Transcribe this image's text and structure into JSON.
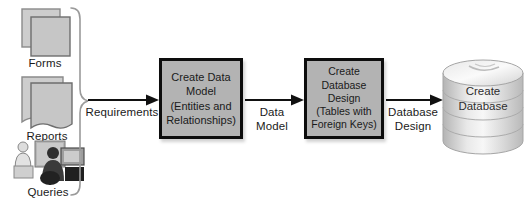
{
  "diagram": {
    "title_hint": "database design process flow",
    "sources": [
      {
        "label": "Forms",
        "icon": "forms-icon"
      },
      {
        "label": "Reports",
        "icon": "reports-icon"
      },
      {
        "label": "Queries",
        "icon": "queries-icon"
      }
    ],
    "flow": {
      "arrow1_label": "Requirements",
      "step1_text": "Create Data\nModel\n(Entities and\nRelationships)",
      "arrow2_label": "Data\nModel",
      "step2_text": "Create\nDatabase\nDesign\n(Tables with\nForeign Keys)",
      "arrow3_label": "Database\nDesign",
      "step3_text": "Create\nDatabase"
    },
    "colors": {
      "box_fill": "#b3b3b3",
      "box_border": "#0d0d0d",
      "icon_fill": "#c9c9c9",
      "icon_stroke": "#7d7d7d",
      "brace": "#9a9a9a",
      "arrow": "#111111",
      "text": "#1a1a1a",
      "cylinder_light": "#f5f5f5",
      "cylinder_dark": "#b9b9b9"
    }
  }
}
